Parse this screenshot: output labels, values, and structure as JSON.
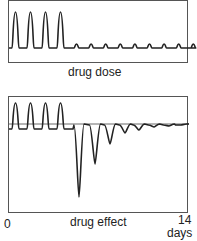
{
  "panels": {
    "top": {
      "label": "drug dose"
    },
    "bottom": {
      "label": "drug effect"
    }
  },
  "axis": {
    "start": "0",
    "end": "14",
    "unit": "days"
  },
  "colors": {
    "line": "#222222",
    "frame": "#555555",
    "reference": "#444444"
  },
  "chart_data": [
    {
      "type": "line",
      "title": "drug dose",
      "xlabel": "days",
      "x_range": [
        0,
        14
      ],
      "description": "Four large periodic dose pulses (days ~0-4) followed by small periodic pulses (days ~4-14)",
      "series": [
        {
          "name": "drug dose",
          "x": [
            0.25,
            1.25,
            2.25,
            3.25,
            4.5,
            5.5,
            6.5,
            7.5,
            8.5,
            9.5,
            10.5,
            11.5,
            12.5
          ],
          "values": [
            1.0,
            1.0,
            1.0,
            1.0,
            0.08,
            0.08,
            0.08,
            0.08,
            0.08,
            0.08,
            0.08,
            0.08,
            0.08
          ]
        }
      ]
    },
    {
      "type": "line",
      "title": "drug effect",
      "xlabel": "days",
      "x_range": [
        0,
        14
      ],
      "description": "Four positive effect pulses above baseline, then abrupt deep negative rebound dips decaying toward baseline",
      "series": [
        {
          "name": "drug effect",
          "x": [
            0.25,
            1.25,
            2.25,
            3.25,
            5.0,
            6.2,
            7.4,
            8.5,
            9.6,
            10.8,
            11.9,
            13.0
          ],
          "values": [
            0.6,
            0.6,
            0.6,
            0.6,
            -2.8,
            -1.9,
            -1.0,
            -0.55,
            -0.35,
            -0.2,
            -0.1,
            -0.05
          ]
        }
      ]
    }
  ]
}
